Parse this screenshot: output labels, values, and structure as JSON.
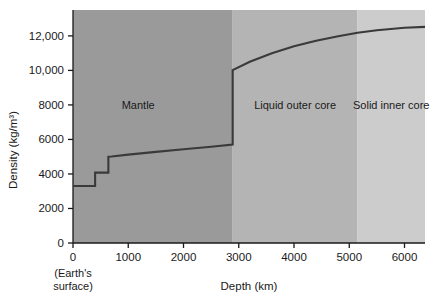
{
  "chart_data": {
    "type": "line",
    "title": "",
    "xlabel": "Depth (km)",
    "ylabel": "Density (kg/m³)",
    "xlim": [
      0,
      6371
    ],
    "ylim": [
      0,
      13500
    ],
    "xticks": [
      0,
      1000,
      2000,
      3000,
      4000,
      5000,
      6000
    ],
    "xtick_labels": [
      "0",
      "1000",
      "2000",
      "3000",
      "4000",
      "5000",
      "6000"
    ],
    "yticks": [
      0,
      2000,
      4000,
      6000,
      8000,
      10000,
      12000
    ],
    "ytick_labels": [
      "0",
      "2000",
      "4000",
      "6000",
      "8000",
      "10,000",
      "12,000"
    ],
    "grid": false,
    "legend": "none",
    "x_origin_note_line1": "(Earth's",
    "x_origin_note_line2": "surface)",
    "series": [
      {
        "name": "Earth density profile",
        "color": "#3a3a3a",
        "points": [
          [
            0,
            3300
          ],
          [
            400,
            3300
          ],
          [
            400,
            4080
          ],
          [
            640,
            4080
          ],
          [
            640,
            5000
          ],
          [
            700,
            5010
          ],
          [
            1000,
            5120
          ],
          [
            1500,
            5280
          ],
          [
            2000,
            5430
          ],
          [
            2500,
            5580
          ],
          [
            2890,
            5700
          ],
          [
            2890,
            10020
          ],
          [
            3200,
            10500
          ],
          [
            3600,
            11000
          ],
          [
            4000,
            11400
          ],
          [
            4400,
            11720
          ],
          [
            4800,
            11980
          ],
          [
            5150,
            12180
          ],
          [
            5500,
            12330
          ],
          [
            6000,
            12470
          ],
          [
            6371,
            12520
          ]
        ]
      }
    ],
    "regions": [
      {
        "name": "Mantle",
        "label": "Mantle",
        "x_start": 0,
        "x_end": 2890,
        "color": "#9a9a9a",
        "label_x": 1180,
        "label_y": 8000
      },
      {
        "name": "Liquid outer core",
        "label": "Liquid outer core",
        "x_start": 2890,
        "x_end": 5150,
        "color": "#b4b4b4",
        "label_x": 4020,
        "label_y": 8000
      },
      {
        "name": "Solid inner core",
        "label": "Solid inner core",
        "x_start": 5150,
        "x_end": 6371,
        "color": "#cccccc",
        "label_x": 5760,
        "label_y": 8000
      }
    ]
  }
}
